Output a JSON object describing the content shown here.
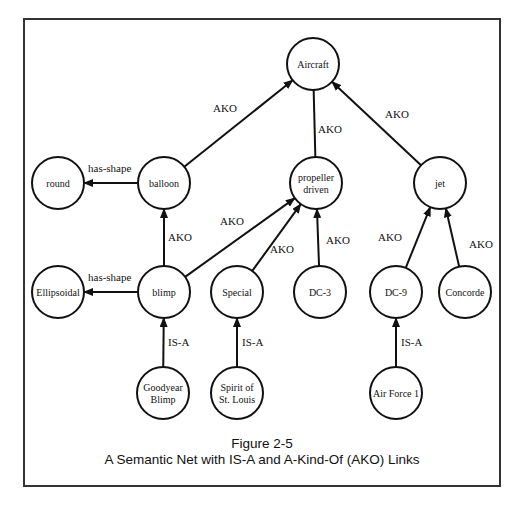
{
  "figure": {
    "number": "Figure 2-5",
    "title": "A Semantic Net with IS-A and A-Kind-Of (AKO) Links"
  },
  "nodes": [
    {
      "id": "aircraft",
      "lines": [
        "Aircraft"
      ],
      "x": 313,
      "y": 64
    },
    {
      "id": "round",
      "lines": [
        "round"
      ],
      "x": 58,
      "y": 183
    },
    {
      "id": "balloon",
      "lines": [
        "balloon"
      ],
      "x": 164,
      "y": 183
    },
    {
      "id": "propeller",
      "lines": [
        "propeller",
        "driven"
      ],
      "x": 316,
      "y": 183
    },
    {
      "id": "jet",
      "lines": [
        "jet"
      ],
      "x": 440,
      "y": 183
    },
    {
      "id": "ellipsoidal",
      "lines": [
        "Ellipsoidal"
      ],
      "x": 58,
      "y": 292
    },
    {
      "id": "blimp",
      "lines": [
        "blimp"
      ],
      "x": 164,
      "y": 292
    },
    {
      "id": "special",
      "lines": [
        "Special"
      ],
      "x": 237,
      "y": 292
    },
    {
      "id": "dc3",
      "lines": [
        "DC-3"
      ],
      "x": 320,
      "y": 292
    },
    {
      "id": "dc9",
      "lines": [
        "DC-9"
      ],
      "x": 396,
      "y": 292
    },
    {
      "id": "concorde",
      "lines": [
        "Concorde"
      ],
      "x": 465,
      "y": 292
    },
    {
      "id": "goodyear",
      "lines": [
        "Goodyear",
        "Blimp"
      ],
      "x": 163,
      "y": 393
    },
    {
      "id": "spirit",
      "lines": [
        "Spirit of",
        "St. Louis"
      ],
      "x": 237,
      "y": 393
    },
    {
      "id": "af1",
      "lines": [
        "Air Force 1"
      ],
      "x": 396,
      "y": 393
    }
  ],
  "edges": [
    {
      "from": "balloon",
      "to": "aircraft",
      "label": "AKO",
      "lx": 213,
      "ly": 112
    },
    {
      "from": "propeller",
      "to": "aircraft",
      "label": "AKO",
      "lx": 318,
      "ly": 133,
      "arrow": false
    },
    {
      "from": "jet",
      "to": "aircraft",
      "label": "AKO",
      "lx": 385,
      "ly": 118
    },
    {
      "from": "balloon",
      "to": "round",
      "label": "has-shape",
      "lx": 88,
      "ly": 172
    },
    {
      "from": "blimp",
      "to": "balloon",
      "label": "AKO",
      "lx": 168,
      "ly": 241
    },
    {
      "from": "blimp",
      "to": "propeller",
      "label": "AKO",
      "lx": 220,
      "ly": 225
    },
    {
      "from": "special",
      "to": "propeller",
      "label": "AKO",
      "lx": 270,
      "ly": 253
    },
    {
      "from": "dc3",
      "to": "propeller",
      "label": "AKO",
      "lx": 326,
      "ly": 244
    },
    {
      "from": "dc9",
      "to": "jet",
      "label": "AKO",
      "lx": 378,
      "ly": 241
    },
    {
      "from": "concorde",
      "to": "jet",
      "label": "AKO",
      "lx": 469,
      "ly": 248
    },
    {
      "from": "blimp",
      "to": "ellipsoidal",
      "label": "has-shape",
      "lx": 88,
      "ly": 281
    },
    {
      "from": "goodyear",
      "to": "blimp",
      "label": "IS-A",
      "lx": 168,
      "ly": 346
    },
    {
      "from": "spirit",
      "to": "special",
      "label": "IS-A",
      "lx": 242,
      "ly": 346
    },
    {
      "from": "af1",
      "to": "dc9",
      "label": "IS-A",
      "lx": 401,
      "ly": 346
    }
  ]
}
